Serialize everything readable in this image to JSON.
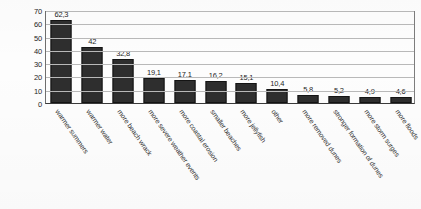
{
  "chart_data": {
    "type": "bar",
    "title": "",
    "xlabel": "",
    "ylabel": "percent (%)",
    "ylim": [
      0,
      70
    ],
    "yticks": [
      0,
      10,
      20,
      30,
      40,
      50,
      60,
      70
    ],
    "ytick_labels": [
      "0",
      "10",
      "20",
      "30",
      "40",
      "50",
      "60",
      "70"
    ],
    "grid": true,
    "legend": false,
    "decimal_separator": ",",
    "categories": [
      "warmer summers",
      "warmer water",
      "more beach wrack",
      "more severe weather events",
      "more coastal erosion",
      "smaller beaches",
      "more jellyfish",
      "other",
      "more removed dunes",
      "stronger formation of dunes",
      "more storm surges",
      "more floods"
    ],
    "values": [
      62.3,
      42,
      32.8,
      19.1,
      17.1,
      16.2,
      15.1,
      10.4,
      5.8,
      5.2,
      4.9,
      4.6
    ],
    "value_labels": [
      "62,3",
      "42",
      "32,8",
      "19,1",
      "17,1",
      "16,2",
      "15,1",
      "10,4",
      "5,8",
      "5,2",
      "4,9",
      "4,6"
    ],
    "bar_color": "#2e2e2e",
    "gridline_color": "#b9b9b9",
    "axis_color": "#3a3a3a",
    "background_color": "#ffffff"
  }
}
